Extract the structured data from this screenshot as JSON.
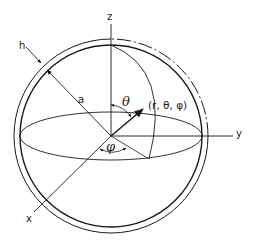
{
  "diagram": {
    "colors": {
      "ink": "#1a1a1a",
      "background": "#ffffff"
    },
    "axes": {
      "z_label": "z",
      "y_label": "y",
      "x_label": "x"
    },
    "labels": {
      "thickness": "h",
      "radius": "a",
      "theta": "θ",
      "phi": "φ",
      "point": "(r, θ, φ)"
    },
    "geometry": {
      "center": [
        111,
        136
      ],
      "inner_radius": 91,
      "outer_radius": 97,
      "equator_ry": 24,
      "point": [
        141,
        111
      ]
    }
  }
}
